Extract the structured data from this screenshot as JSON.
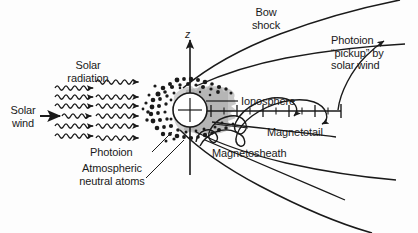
{
  "figure": {
    "width": 418,
    "height": 233,
    "background_color": "#fdfdfd",
    "ink_color": "#1a1a1a",
    "shade_color": "#9d9d9d"
  },
  "labels": {
    "solar_radiation": "Solar\nradiation",
    "solar_wind": "Solar\nwind",
    "photoion_left": "Photoion",
    "atmospheric_neutral_atoms": "Atmospheric\nneutral atoms",
    "axis_z": "z",
    "bow_shock": "Bow\nshock",
    "photoion_pickup": "Photoion\n“pickup” by\nsolar wind",
    "ionosphere": "Ionosphere",
    "magnetotail": "Magnetotail",
    "magnetosheath": "Magnetosheath"
  },
  "annotations": {
    "wavy_arrow_count": 9,
    "photoion_trajectory_count": 2,
    "axis_tick_count": 11,
    "planet_center": {
      "x": 190,
      "y": 110
    },
    "planet_radius": 17
  }
}
